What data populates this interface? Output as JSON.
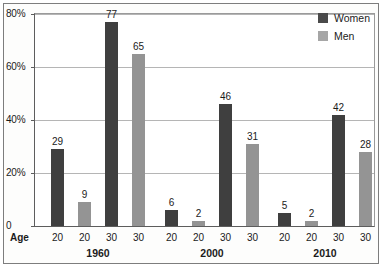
{
  "chart_data": {
    "type": "bar",
    "title": "",
    "subtitle": "",
    "xlabel": "Age",
    "ylabel": "",
    "ylim": [
      0,
      80
    ],
    "yticks": [
      0,
      20,
      40,
      60,
      80
    ],
    "ytick_labels": [
      "0",
      "20%",
      "40%",
      "60%",
      "80%"
    ],
    "grid": true,
    "legend_position": "top-right",
    "group_axis_label": "Age",
    "groups": [
      {
        "label": "1960",
        "bars": [
          {
            "age": "20",
            "series": "Women",
            "value": 29
          },
          {
            "age": "20",
            "series": "Men",
            "value": 9
          },
          {
            "age": "30",
            "series": "Women",
            "value": 77
          },
          {
            "age": "30",
            "series": "Men",
            "value": 65
          }
        ]
      },
      {
        "label": "2000",
        "bars": [
          {
            "age": "20",
            "series": "Women",
            "value": 6
          },
          {
            "age": "20",
            "series": "Men",
            "value": 2
          },
          {
            "age": "30",
            "series": "Women",
            "value": 46
          },
          {
            "age": "30",
            "series": "Men",
            "value": 31
          }
        ]
      },
      {
        "label": "2010",
        "bars": [
          {
            "age": "20",
            "series": "Women",
            "value": 5
          },
          {
            "age": "20",
            "series": "Men",
            "value": 2
          },
          {
            "age": "30",
            "series": "Women",
            "value": 42
          },
          {
            "age": "30",
            "series": "Men",
            "value": 28
          }
        ]
      }
    ],
    "series": [
      {
        "name": "Women",
        "color": "#3f3f3f",
        "values": [
          29,
          77,
          6,
          46,
          5,
          42
        ]
      },
      {
        "name": "Men",
        "color": "#949494",
        "values": [
          9,
          65,
          2,
          31,
          2,
          28
        ]
      }
    ],
    "categories": [
      "1960 / 20",
      "1960 / 30",
      "2000 / 20",
      "2000 / 30",
      "2010 / 20",
      "2010 / 30"
    ]
  },
  "legend": {
    "items": [
      {
        "label": "Women",
        "color": "#3f3f3f"
      },
      {
        "label": "Men",
        "color": "#949494"
      }
    ]
  },
  "colors": {
    "women": "#3f3f3f",
    "men": "#949494",
    "gridline": "#b5b5b5",
    "axis": "#5d5d5d",
    "text": "#1b1b1b",
    "frame": "#7d7d7d",
    "background": "#fdfdfc"
  }
}
